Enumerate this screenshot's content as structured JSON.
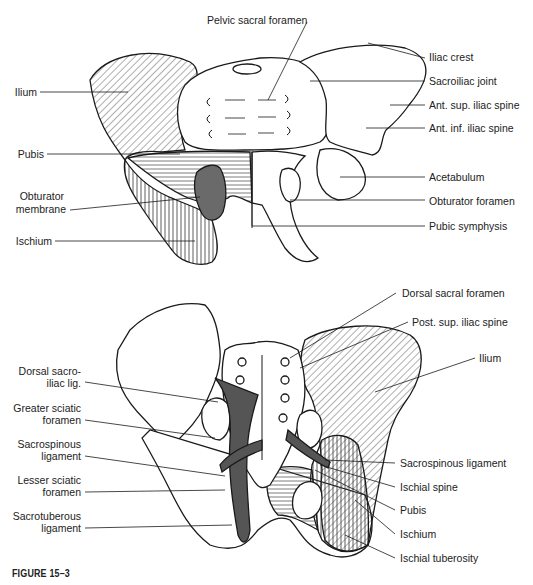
{
  "figure": {
    "caption": "FIGURE 15–3"
  },
  "anterior_view": {
    "labels_top": [
      "Pelvic sacral foramen"
    ],
    "labels_left": [
      "Ilium",
      "Pubis",
      "Obturator",
      "membrane",
      "Ischium"
    ],
    "labels_right": [
      "Iliac crest",
      "Sacroiliac joint",
      "Ant. sup. iliac spine",
      "Ant. inf. iliac spine",
      "Acetabulum",
      "Obturator foramen",
      "Pubic symphysis"
    ]
  },
  "posterior_view": {
    "labels_left": [
      "Dorsal sacro-",
      "iliac lig.",
      "Greater sciatic",
      "foramen",
      "Sacrospinous",
      "ligament",
      "Lesser sciatic",
      "foramen",
      "Sacrotuberous",
      "ligament"
    ],
    "labels_right": [
      "Dorsal sacral foramen",
      "Post. sup. iliac spine",
      "Ilium",
      "Sacrospinous ligament",
      "Ischial spine",
      "Pubis",
      "Ischium",
      "Ischial tuberosity"
    ]
  },
  "colors": {
    "line": "#1a1a1a",
    "ligament_fill": "#555555",
    "membrane_fill": "#6a6a6a"
  }
}
